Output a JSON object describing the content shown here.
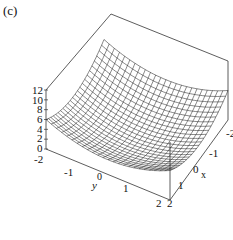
{
  "figure": {
    "panel_label": "(c)"
  },
  "chart_data": {
    "type": "surface3d",
    "title": "",
    "function": "z = x^2 + y^2",
    "xlabel": "x",
    "ylabel": "y",
    "zlabel": "",
    "x_range": [
      -2,
      2
    ],
    "y_range": [
      -2,
      2
    ],
    "z_range": [
      0,
      12
    ],
    "x_ticks": [
      "-2",
      "-1",
      "0",
      "1",
      "2"
    ],
    "y_ticks": [
      "-2",
      "-1",
      "0",
      "1",
      "2"
    ],
    "z_ticks": [
      "0",
      "2",
      "4",
      "6",
      "8",
      "10",
      "12"
    ],
    "grid": false,
    "mesh": "wireframe",
    "legend": null
  },
  "labels": {
    "z": [
      "12",
      "10",
      "8",
      "6",
      "4",
      "2",
      "0"
    ],
    "y_axis": {
      "m2": "-2",
      "m1": "-1",
      "zero": "0",
      "one": "1",
      "two": "2",
      "name": "y"
    },
    "x_axis": {
      "m2": "-2",
      "m1": "-1",
      "zero": "0",
      "one": "1",
      "two": "2",
      "name": "x"
    }
  }
}
